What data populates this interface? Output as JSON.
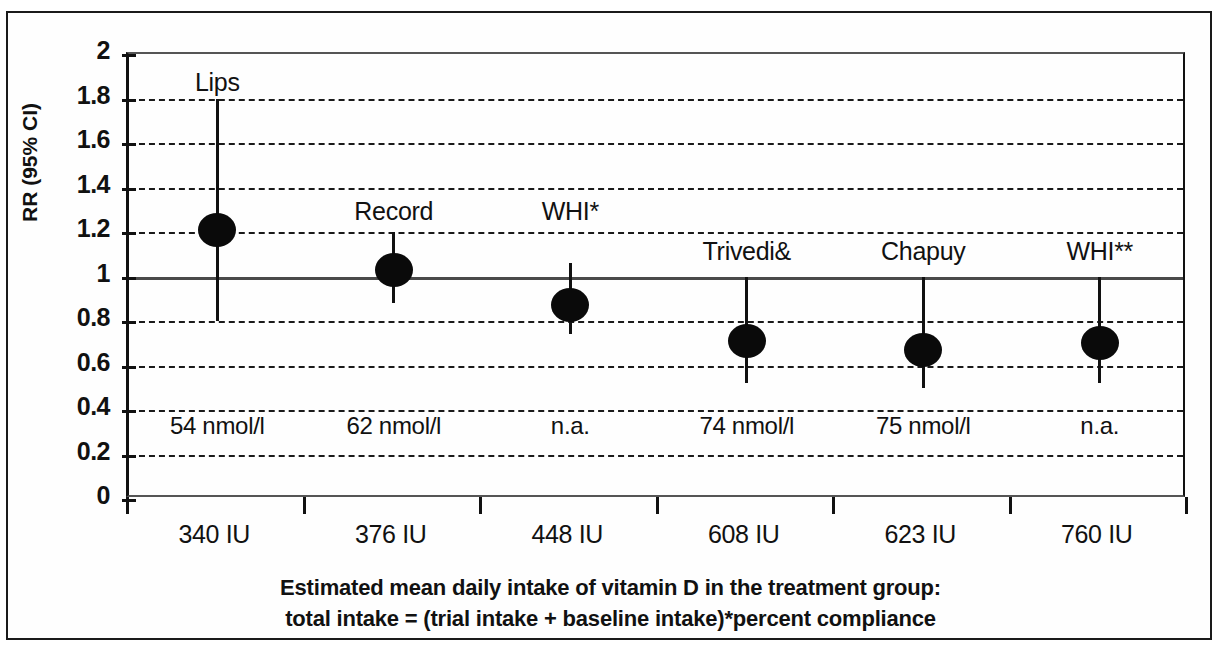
{
  "chart_data": {
    "type": "scatter",
    "title": "",
    "xlabel": "Estimated mean daily intake of vitamin D in the treatment group: total intake = (trial intake + baseline intake)*percent compliance",
    "xlabel_line1": "Estimated mean daily intake of vitamin D in the treatment group:",
    "xlabel_line2": "total intake = (trial intake + baseline intake)*percent compliance",
    "ylabel": "RR (95% CI)",
    "ylim": [
      0,
      2
    ],
    "yticks": [
      "0",
      "0.2",
      "0.4",
      "0.6",
      "0.8",
      "1",
      "1.2",
      "1.4",
      "1.6",
      "1.8",
      "2"
    ],
    "ytick_values": [
      0,
      0.2,
      0.4,
      0.6,
      0.8,
      1,
      1.2,
      1.4,
      1.6,
      1.8,
      2
    ],
    "grid": true,
    "reference_line": 1,
    "legend": "none",
    "categories": [
      "340 IU",
      "376 IU",
      "448 IU",
      "608 IU",
      "623 IU",
      "760 IU"
    ],
    "series": [
      {
        "name": "Lips",
        "category": "340 IU",
        "value": 1.21,
        "ci_low": 0.8,
        "ci_high": 1.8,
        "note": "54 nmol/l",
        "label_y": 1.86
      },
      {
        "name": "Record",
        "category": "376 IU",
        "value": 1.03,
        "ci_low": 0.88,
        "ci_high": 1.2,
        "note": "62 nmol/l",
        "label_y": 1.28
      },
      {
        "name": "WHI*",
        "category": "448 IU",
        "value": 0.87,
        "ci_low": 0.74,
        "ci_high": 1.06,
        "note": "n.a.",
        "label_y": 1.28
      },
      {
        "name": "Trivedi&",
        "category": "608 IU",
        "value": 0.71,
        "ci_low": 0.52,
        "ci_high": 1.0,
        "note": "74 nmol/l",
        "label_y": 1.1
      },
      {
        "name": "Chapuy",
        "category": "623 IU",
        "value": 0.67,
        "ci_low": 0.5,
        "ci_high": 1.0,
        "note": "75 nmol/l",
        "label_y": 1.1
      },
      {
        "name": "WHI**",
        "category": "760 IU",
        "value": 0.7,
        "ci_low": 0.52,
        "ci_high": 1.0,
        "note": "n.a.",
        "label_y": 1.1
      }
    ],
    "note_y": 0.32,
    "colors": {
      "marker": "#0a0a0a",
      "axis": "#111111",
      "grid": "#1a1a1a",
      "reference": "#4a4a4a",
      "background": "#fefefe"
    }
  }
}
